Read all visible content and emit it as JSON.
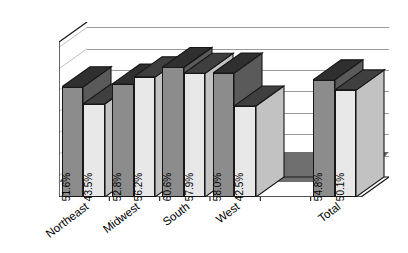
{
  "chart_data": {
    "type": "bar",
    "title": "",
    "subtitle": "",
    "xlabel": "",
    "ylabel": "",
    "categories": [
      "Northeast",
      "Midwest",
      "South",
      "West",
      "",
      "Total"
    ],
    "series": [
      {
        "name": "Series 1",
        "values": [
          51.6,
          52.8,
          60.6,
          58.0,
          null,
          54.8
        ],
        "color": "#8c8c8c"
      },
      {
        "name": "Series 2",
        "values": [
          43.5,
          56.2,
          57.9,
          42.5,
          null,
          50.1
        ],
        "color": "#e8e8e8"
      }
    ],
    "data_labels": [
      [
        "51.6%",
        "52.8%",
        "60.6%",
        "58.0%",
        "",
        "54.8%"
      ],
      [
        "43.5%",
        "56.2%",
        "57.9%",
        "42.5%",
        "",
        "50.1%"
      ]
    ],
    "ylim": [
      0,
      70
    ],
    "ytick_values": [
      0,
      10,
      20,
      30,
      40,
      50,
      60,
      70
    ],
    "ytick_labels": [
      "0.0%",
      "10.0%",
      "20.0%",
      "30.0%",
      "40.0%",
      "50.0%",
      "60.0%",
      "70.0%"
    ],
    "grid": true,
    "grid_axis": "y",
    "legend": "none",
    "three_d": true,
    "value_labels_rotated": true,
    "style": {
      "plot_background": "#ffffff",
      "floor_color": "#6f6f6f",
      "gridline_color": "#9a9a9a",
      "axis_color": "#1a1a1a",
      "text_color": "#000000"
    }
  }
}
